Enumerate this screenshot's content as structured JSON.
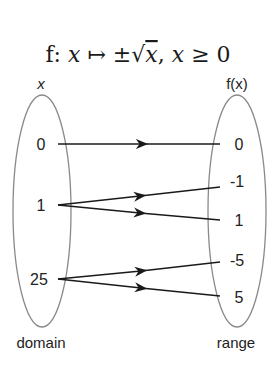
{
  "title": {
    "prefix": "f: ",
    "x1": "x",
    "mapsto": " ↦ ±",
    "sqrt_arg": "x",
    "comma": ", ",
    "x2": "x",
    "condition": " ≥ 0"
  },
  "domain": {
    "header": "x",
    "caption": "domain",
    "values": [
      "0",
      "1",
      "25"
    ]
  },
  "range": {
    "header": "f(x)",
    "caption": "range",
    "values": [
      "0",
      "-1",
      "1",
      "-5",
      "5"
    ]
  },
  "mappings": [
    {
      "from": "0",
      "to": "0"
    },
    {
      "from": "1",
      "to": "-1"
    },
    {
      "from": "1",
      "to": "1"
    },
    {
      "from": "25",
      "to": "-5"
    },
    {
      "from": "25",
      "to": "5"
    }
  ],
  "colors": {
    "ellipse": "#8a8a8a",
    "arrow": "#1a1a1a",
    "text": "#222222"
  }
}
